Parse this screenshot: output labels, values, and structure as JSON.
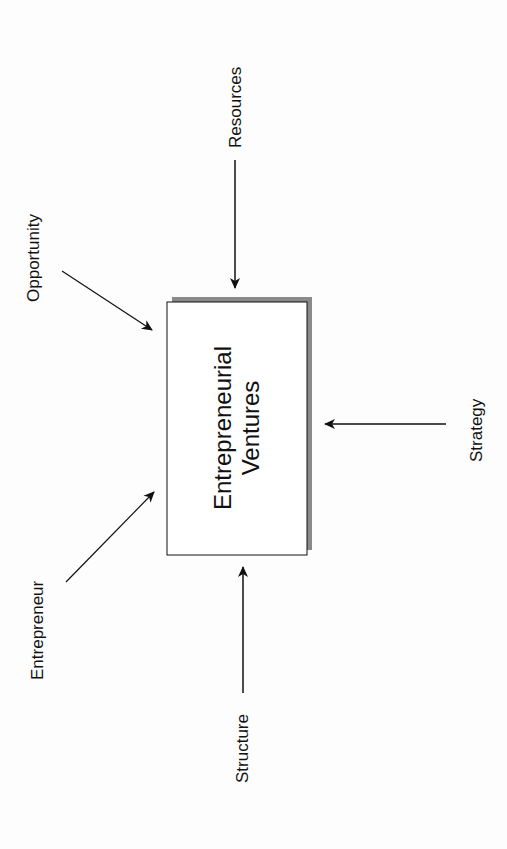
{
  "diagram": {
    "center": {
      "line1": "Entrepreneurial",
      "line2": "Ventures"
    },
    "inputs": [
      {
        "id": "resources",
        "label": "Resources"
      },
      {
        "id": "opportunity",
        "label": "Opportunity"
      },
      {
        "id": "entrepreneur",
        "label": "Entrepreneur"
      },
      {
        "id": "structure",
        "label": "Structure"
      },
      {
        "id": "strategy",
        "label": "Strategy"
      }
    ],
    "colors": {
      "line": "#111111",
      "shadow": "#8a8a8a",
      "background": "#fdfdfd"
    }
  }
}
